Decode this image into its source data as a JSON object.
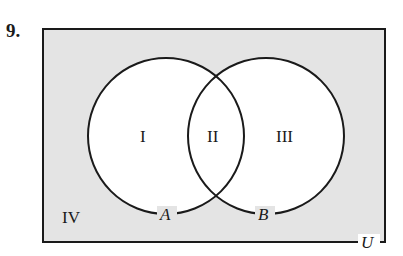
{
  "problem": {
    "number": "9."
  },
  "diagram": {
    "type": "venn",
    "universe_label": "U",
    "sets": [
      {
        "name": "A",
        "label": "A"
      },
      {
        "name": "B",
        "label": "B"
      }
    ],
    "regions": [
      {
        "id": "I",
        "label": "I",
        "description": "A only"
      },
      {
        "id": "II",
        "label": "II",
        "description": "A and B"
      },
      {
        "id": "III",
        "label": "III",
        "description": "B only"
      },
      {
        "id": "IV",
        "label": "IV",
        "description": "outside A and B"
      }
    ],
    "colors": {
      "universe_fill": "#e4e4e4",
      "circle_fill": "#ffffff",
      "stroke": "#1a1a1a"
    }
  }
}
